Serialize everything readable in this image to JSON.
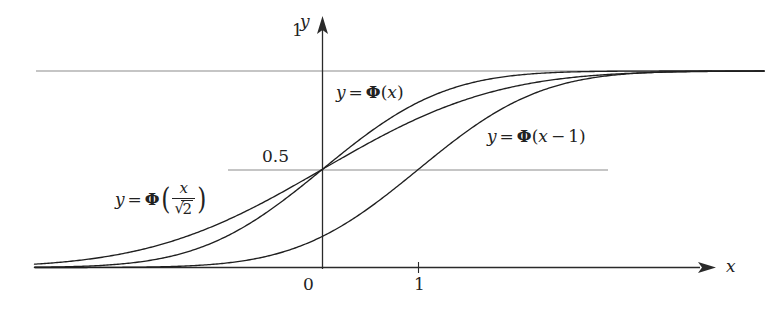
{
  "figure": {
    "background_color": "#ffffff",
    "curve_color": "#1f1f1f",
    "grid_color": "#8c8c8c",
    "axis_color": "#2a2a2a"
  },
  "axes": {
    "x_axis_label": "x",
    "y_axis_label": "y",
    "x_ticks": [
      {
        "label": "0",
        "value": 0
      },
      {
        "label": "1",
        "value": 1
      }
    ],
    "y_ticks": [
      {
        "label": "0.5",
        "value": 0.5
      },
      {
        "label": "1",
        "value": 1
      }
    ]
  },
  "curve_labels": {
    "phi_x": {
      "lhs": "y",
      "eq": "=",
      "phi": "Φ",
      "arg_open": "(",
      "arg": "x",
      "arg_close": ")"
    },
    "phi_x_minus_1": {
      "lhs": "y",
      "eq": "=",
      "phi": "Φ",
      "arg_open": "(",
      "arg_var": "x",
      "minus": "−",
      "arg_num": "1",
      "arg_close": ")"
    },
    "phi_x_over_sqrt2": {
      "lhs": "y",
      "eq": "=",
      "phi": "Φ",
      "paren_open": "(",
      "numerator": "x",
      "sqrt_symbol": "√",
      "denominator": "2",
      "paren_close": ")"
    }
  },
  "chart_data": {
    "type": "line",
    "title": "",
    "subtitle": "",
    "xlabel": "x",
    "ylabel": "y",
    "xlim": [
      -3.0,
      4.6
    ],
    "ylim": [
      -0.05,
      1.12
    ],
    "grid": true,
    "gridlines_y": [
      0.5,
      1.0
    ],
    "legend": "inline annotations",
    "xticks": [
      0,
      1
    ],
    "xticklabels": [
      "0",
      "1"
    ],
    "yticks": [
      0.5,
      1
    ],
    "yticklabels": [
      "0.5",
      "1"
    ],
    "annotations": [
      {
        "text": "y = Φ(x)",
        "x": 0.12,
        "y": 0.94
      },
      {
        "text": "y = Φ(x−1)",
        "x": 1.85,
        "y": 0.72
      },
      {
        "text": "y = Φ(x/√2)",
        "x": -2.25,
        "y": 0.37
      }
    ],
    "series": [
      {
        "name": "y = Φ(x/√2)",
        "formula": "Phi(x/sqrt(2))",
        "mean": 0,
        "sigma": 1.4142135624,
        "x": [
          -3.0,
          -2.6,
          -2.2,
          -1.8,
          -1.4,
          -1.0,
          -0.6,
          -0.2,
          0.0,
          0.2,
          0.6,
          1.0,
          1.4,
          1.8,
          2.2,
          2.6,
          3.0,
          3.4,
          3.8,
          4.2,
          4.6
        ],
        "values": [
          0.017,
          0.033,
          0.06,
          0.102,
          0.161,
          0.24,
          0.336,
          0.444,
          0.5,
          0.556,
          0.664,
          0.76,
          0.839,
          0.898,
          0.94,
          0.967,
          0.983,
          0.992,
          0.996,
          0.998,
          0.999
        ]
      },
      {
        "name": "y = Φ(x)",
        "formula": "Phi(x)",
        "mean": 0,
        "sigma": 1,
        "x": [
          -3.0,
          -2.6,
          -2.2,
          -1.8,
          -1.4,
          -1.0,
          -0.6,
          -0.2,
          0.0,
          0.2,
          0.6,
          1.0,
          1.4,
          1.8,
          2.2,
          2.6,
          3.0,
          3.4,
          3.8,
          4.2,
          4.6
        ],
        "values": [
          0.0013,
          0.0047,
          0.0139,
          0.0359,
          0.0808,
          0.1587,
          0.2743,
          0.4207,
          0.5,
          0.5793,
          0.7257,
          0.8413,
          0.9192,
          0.9641,
          0.9861,
          0.9953,
          0.9987,
          0.9997,
          0.9999,
          1.0,
          1.0
        ]
      },
      {
        "name": "y = Φ(x−1)",
        "formula": "Phi(x-1)",
        "mean": 1,
        "sigma": 1,
        "x": [
          -3.0,
          -2.6,
          -2.2,
          -1.8,
          -1.4,
          -1.0,
          -0.6,
          -0.2,
          0.0,
          0.2,
          0.6,
          1.0,
          1.4,
          1.8,
          2.2,
          2.6,
          3.0,
          3.4,
          3.8,
          4.2,
          4.6
        ],
        "values": [
          3e-05,
          0.0002,
          0.0007,
          0.0026,
          0.0082,
          0.0228,
          0.0548,
          0.1151,
          0.1587,
          0.2119,
          0.3446,
          0.5,
          0.6554,
          0.7881,
          0.8849,
          0.9452,
          0.9772,
          0.9918,
          0.9974,
          0.9993,
          0.9998
        ]
      }
    ]
  }
}
